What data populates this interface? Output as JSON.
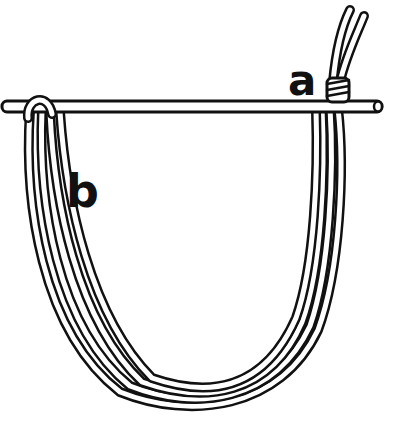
{
  "diagram": {
    "type": "line-drawing",
    "labels": [
      {
        "id": "a",
        "text": "a",
        "position": "upper right, left of binding"
      },
      {
        "id": "b",
        "text": "b",
        "position": "left, below stick"
      }
    ],
    "colors": {
      "ink": "#111111",
      "paper": "#ffffff"
    },
    "elements": {
      "stick": "horizontal rod spanning width, rounded ends",
      "binding": "several wraps around two strands at right end of stick",
      "free_ends": "two cord ends rising up-right above binding",
      "loop": "doubled cord hanging below stick in U shape, passing over stick at left"
    }
  }
}
